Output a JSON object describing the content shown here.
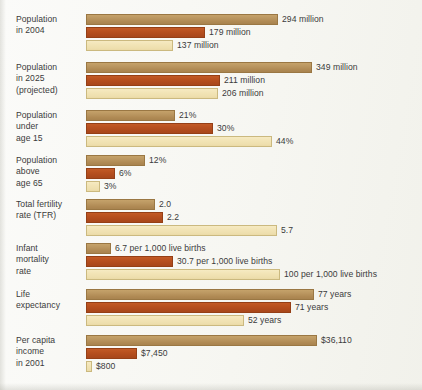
{
  "chart_data": {
    "type": "bar",
    "orientation": "horizontal",
    "title": "",
    "xlabel": "",
    "ylabel": "",
    "grid": false,
    "legend_position": "none",
    "series": [
      {
        "name": "series-1",
        "color": "#b89259"
      },
      {
        "name": "series-2",
        "color": "#b9511f"
      },
      {
        "name": "series-3",
        "color": "#f1e3b3"
      }
    ],
    "categories": [
      "Population in 2004",
      "Population in 2025 (projected)",
      "Population under age 15",
      "Population above age 65",
      "Total fertility rate (TFR)",
      "Infant mortality rate",
      "Life expectancy",
      "Per capita income in 2001"
    ],
    "groups": [
      {
        "label_lines": [
          "Population",
          "in 2004"
        ],
        "unit": "million",
        "bars": [
          {
            "value": 294,
            "label": "294 million",
            "width_px": 192
          },
          {
            "value": 179,
            "label": "179 million",
            "width_px": 119
          },
          {
            "value": 137,
            "label": "137 million",
            "width_px": 87
          }
        ]
      },
      {
        "label_lines": [
          "Population",
          "in 2025",
          "(projected)"
        ],
        "unit": "million",
        "bars": [
          {
            "value": 349,
            "label": "349 million",
            "width_px": 226
          },
          {
            "value": 211,
            "label": "211 million",
            "width_px": 134
          },
          {
            "value": 206,
            "label": "206 million",
            "width_px": 132
          }
        ]
      },
      {
        "label_lines": [
          "Population",
          "under",
          "age 15"
        ],
        "unit": "%",
        "bars": [
          {
            "value": 21,
            "label": "21%",
            "width_px": 89
          },
          {
            "value": 30,
            "label": "30%",
            "width_px": 127
          },
          {
            "value": 44,
            "label": "44%",
            "width_px": 186
          }
        ]
      },
      {
        "label_lines": [
          "Population",
          "above",
          "age 65"
        ],
        "unit": "%",
        "bars": [
          {
            "value": 12,
            "label": "12%",
            "width_px": 59
          },
          {
            "value": 6,
            "label": "6%",
            "width_px": 29
          },
          {
            "value": 3,
            "label": "3%",
            "width_px": 14
          }
        ]
      },
      {
        "label_lines": [
          "Total fertility",
          "rate (TFR)"
        ],
        "unit": "",
        "bars": [
          {
            "value": 2.0,
            "label": "2.0",
            "width_px": 69
          },
          {
            "value": 2.2,
            "label": "2.2",
            "width_px": 77
          },
          {
            "value": 5.7,
            "label": "5.7",
            "width_px": 191
          }
        ]
      },
      {
        "label_lines": [
          "Infant",
          "mortality",
          "rate"
        ],
        "unit": "per 1,000 live births",
        "bars": [
          {
            "value": 6.7,
            "label": "6.7 per 1,000 live births",
            "width_px": 25
          },
          {
            "value": 30.7,
            "label": "30.7 per 1,000 live births",
            "width_px": 87
          },
          {
            "value": 100,
            "label": "100 per 1,000 live births",
            "width_px": 194
          }
        ]
      },
      {
        "label_lines": [
          "Life",
          "expectancy"
        ],
        "unit": "years",
        "bars": [
          {
            "value": 77,
            "label": "77 years",
            "width_px": 228
          },
          {
            "value": 71,
            "label": "71 years",
            "width_px": 205
          },
          {
            "value": 52,
            "label": "52 years",
            "width_px": 158
          }
        ]
      },
      {
        "label_lines": [
          "Per capita",
          "income",
          "in 2001"
        ],
        "unit": "$",
        "bars": [
          {
            "value": 36110,
            "label": "$36,110",
            "width_px": 231
          },
          {
            "value": 7450,
            "label": "$7,450",
            "width_px": 51
          },
          {
            "value": 800,
            "label": "$800",
            "width_px": 6
          }
        ]
      }
    ]
  }
}
